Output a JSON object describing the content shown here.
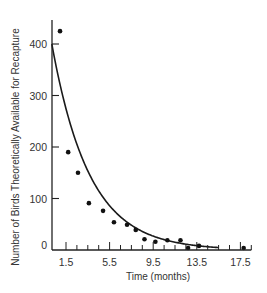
{
  "chart_data": {
    "type": "scatter",
    "title": "",
    "xlabel": "Time (months)",
    "ylabel": "Number of Birds Theoretically Available for Recapture",
    "xlim": [
      0.2,
      18.5
    ],
    "ylim": [
      0,
      450
    ],
    "x_ticks": [
      1.5,
      5.5,
      9.5,
      13.5,
      17.5
    ],
    "x_tick_labels": [
      "1.5",
      "5.5",
      "9.5",
      "13.5",
      "17.5"
    ],
    "x_minor_tick_step": 1,
    "y_ticks": [
      0,
      100,
      200,
      300,
      400
    ],
    "y_tick_labels": [
      "0",
      "100",
      "200",
      "300",
      "400"
    ],
    "grid": false,
    "legend": null,
    "series": [
      {
        "name": "Observed",
        "kind": "scatter",
        "x": [
          0.95,
          1.7,
          2.6,
          3.6,
          4.9,
          5.9,
          7.1,
          7.9,
          8.7,
          9.7,
          10.8,
          12.0,
          12.7,
          13.7,
          17.8
        ],
        "y": [
          425,
          190,
          150,
          91,
          76,
          54,
          49,
          39,
          21,
          16,
          19,
          19,
          4,
          8,
          4
        ]
      },
      {
        "name": "Theoretical decay",
        "kind": "line",
        "model": "400 * exp(-0.29 * (t - 0.2))",
        "x": [
          0.2,
          1.5,
          2.5,
          3.5,
          4.5,
          5.5,
          6.5,
          7.5,
          8.5,
          9.5,
          10.5,
          11.5,
          12.5,
          13.5,
          14.5,
          15.5
        ],
        "y": [
          400,
          275,
          205,
          154,
          115,
          86,
          64,
          48,
          36,
          27,
          20,
          15,
          11,
          8,
          6,
          4
        ]
      }
    ]
  }
}
